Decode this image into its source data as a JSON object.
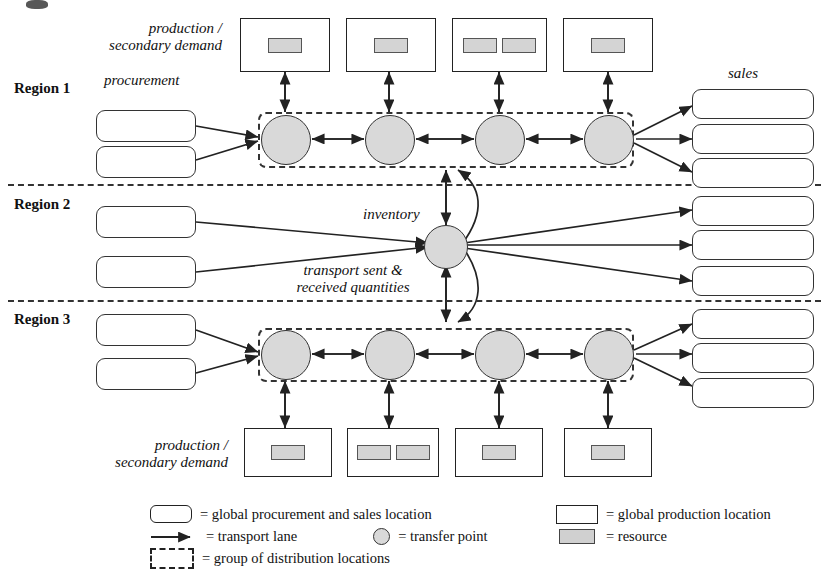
{
  "diagram": {
    "annotations": {
      "production_top": "production /\nsecondary demand",
      "production_bottom": "production /\nsecondary demand",
      "procurement": "procurement",
      "sales": "sales",
      "inventory": "inventory",
      "transport": "transport sent &\nreceived quantities"
    },
    "regions": [
      {
        "id": "region-1",
        "label": "Region 1"
      },
      {
        "id": "region-2",
        "label": "Region 2"
      },
      {
        "id": "region-3",
        "label": "Region 3"
      }
    ],
    "region1": {
      "procurement_boxes": [
        {
          "label": ""
        },
        {
          "label": ""
        }
      ],
      "transfer_points": [
        {
          "label": ""
        },
        {
          "label": ""
        },
        {
          "label": ""
        },
        {
          "label": ""
        }
      ],
      "production_boxes": [
        {
          "resources": 1
        },
        {
          "resources": 1
        },
        {
          "resources": 2
        },
        {
          "resources": 1
        }
      ],
      "sales_boxes": [
        {
          "label": ""
        },
        {
          "label": ""
        },
        {
          "label": ""
        }
      ]
    },
    "region2": {
      "procurement_boxes": [
        {
          "label": ""
        },
        {
          "label": ""
        }
      ],
      "inventory_nodes": [
        {
          "label": ""
        }
      ],
      "sales_boxes": [
        {
          "label": ""
        },
        {
          "label": ""
        },
        {
          "label": ""
        }
      ]
    },
    "region3": {
      "procurement_boxes": [
        {
          "label": ""
        },
        {
          "label": ""
        }
      ],
      "transfer_points": [
        {
          "label": ""
        },
        {
          "label": ""
        },
        {
          "label": ""
        },
        {
          "label": ""
        }
      ],
      "production_boxes": [
        {
          "resources": 1
        },
        {
          "resources": 2
        },
        {
          "resources": 1
        },
        {
          "resources": 1
        }
      ],
      "sales_boxes": [
        {
          "label": ""
        },
        {
          "label": ""
        },
        {
          "label": ""
        }
      ]
    },
    "legend": {
      "items": [
        {
          "symbol": "rounded-box",
          "text": "= global procurement and sales location"
        },
        {
          "symbol": "arrow",
          "text": "= transport lane"
        },
        {
          "symbol": "circle",
          "text": "= transfer point"
        },
        {
          "symbol": "dashed-box",
          "text": "= group of distribution locations"
        },
        {
          "symbol": "square-box",
          "text": "= global production location"
        },
        {
          "symbol": "resource-bar",
          "text": "= resource"
        }
      ]
    },
    "colors": {
      "node_fill": "#d9d9d9",
      "resource_fill": "#d4d4d4",
      "stroke": "#333333",
      "background": "#ffffff"
    }
  }
}
